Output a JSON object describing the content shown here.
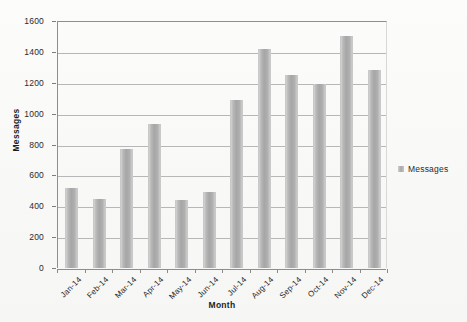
{
  "chart_data": {
    "type": "bar",
    "title": "",
    "subtitle": "",
    "xlabel": "Month",
    "ylabel": "Messages",
    "categories": [
      "Jan-14",
      "Feb-14",
      "Mar-14",
      "Apr-14",
      "May-14",
      "Jun-14",
      "Jul-14",
      "Aug-14",
      "Sep-14",
      "Oct-14",
      "Nov-14",
      "Dec-14"
    ],
    "series": [
      {
        "name": "Messages",
        "values": [
          520,
          450,
          770,
          930,
          440,
          495,
          1090,
          1420,
          1250,
          1195,
          1500,
          1280
        ]
      }
    ],
    "ylim": [
      0,
      1600
    ],
    "ytick_labels": [
      "1600",
      "1400",
      "1200",
      "1000",
      "800",
      "600",
      "400",
      "200",
      "0"
    ],
    "ytick_values": [
      1600,
      1400,
      1200,
      1000,
      800,
      600,
      400,
      200,
      0
    ],
    "grid": true,
    "grid_axis": "y",
    "legend": {
      "position": "right",
      "entries": [
        "Messages"
      ]
    },
    "colors": {
      "bar": "#a6a6a6",
      "gridline": "#b7b7b7",
      "axis": "#8e8e8e",
      "text": "#1a1a1a",
      "background": "#fbfbfa"
    }
  }
}
